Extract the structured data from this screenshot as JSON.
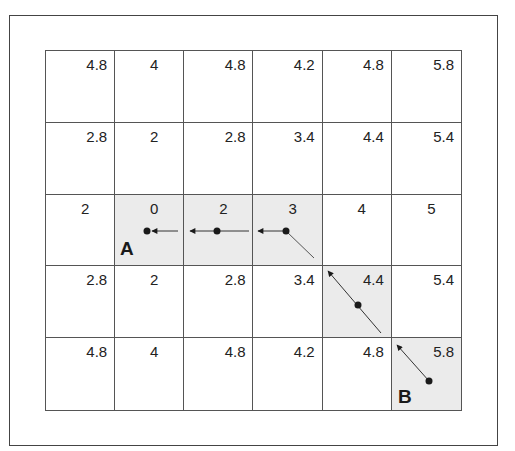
{
  "diagram": {
    "type": "grid-path",
    "rows": 5,
    "cols": 6,
    "cells": [
      [
        "4.8",
        "4",
        "4.8",
        "4.2",
        "4.8",
        "5.8"
      ],
      [
        "2.8",
        "2",
        "2.8",
        "3.4",
        "4.4",
        "5.4"
      ],
      [
        "2",
        "0",
        "2",
        "3",
        "4",
        "5"
      ],
      [
        "2.8",
        "2",
        "2.8",
        "3.4",
        "4.4",
        "5.4"
      ],
      [
        "4.8",
        "4",
        "4.8",
        "4.2",
        "4.8",
        "5.8"
      ]
    ],
    "shaded_cells": [
      [
        2,
        1
      ],
      [
        2,
        2
      ],
      [
        2,
        3
      ],
      [
        3,
        4
      ],
      [
        4,
        5
      ]
    ],
    "start_label": "A",
    "start_cell": [
      2,
      1
    ],
    "end_label": "B",
    "end_cell": [
      4,
      5
    ],
    "path_direction": "from B toward A",
    "colors": {
      "shade": "#ebebeb",
      "line": "#555555",
      "arrow": "#1a1a1a"
    }
  },
  "labels": {
    "a": "A",
    "b": "B"
  }
}
